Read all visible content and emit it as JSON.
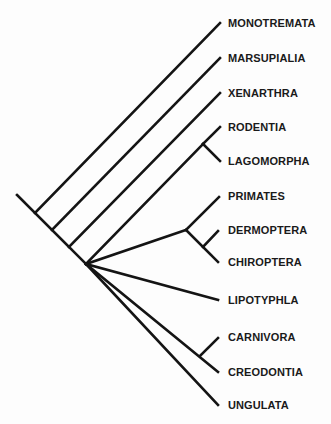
{
  "diagram": {
    "type": "cladogram",
    "colors": {
      "line": "#141414",
      "text": "#1a1a1a",
      "background": "#fdfdfd"
    },
    "taxa": [
      {
        "label": "MONOTREMATA",
        "y": 23
      },
      {
        "label": "MARSUPIALIA",
        "y": 58
      },
      {
        "label": "XENARTHRA",
        "y": 93
      },
      {
        "label": "RODENTIA",
        "y": 127
      },
      {
        "label": "LAGOMORPHA",
        "y": 161
      },
      {
        "label": "PRIMATES",
        "y": 196
      },
      {
        "label": "DERMOPTERA",
        "y": 230
      },
      {
        "label": "CHIROPTERA",
        "y": 262
      },
      {
        "label": "LIPOTYPHLA",
        "y": 300
      },
      {
        "label": "CARNIVORA",
        "y": 337
      },
      {
        "label": "CREODONTIA",
        "y": 372
      },
      {
        "label": "UNGULATA",
        "y": 405
      }
    ],
    "edges": [
      {
        "name": "root-stem",
        "x1": 17,
        "y1": 195,
        "x2": 86,
        "y2": 264
      },
      {
        "name": "branch-monotremata",
        "x1": 35,
        "y1": 213,
        "x2": 220,
        "y2": 23
      },
      {
        "name": "branch-marsupialia",
        "x1": 52,
        "y1": 230,
        "x2": 220,
        "y2": 58
      },
      {
        "name": "branch-xenarthra",
        "x1": 69,
        "y1": 247,
        "x2": 220,
        "y2": 93
      },
      {
        "name": "branch-glires",
        "x1": 86,
        "y1": 264,
        "x2": 203,
        "y2": 144
      },
      {
        "name": "branch-rodentia",
        "x1": 203,
        "y1": 144,
        "x2": 220,
        "y2": 127
      },
      {
        "name": "branch-lagomorpha",
        "x1": 203,
        "y1": 144,
        "x2": 220,
        "y2": 161
      },
      {
        "name": "branch-archonta",
        "x1": 86,
        "y1": 264,
        "x2": 186,
        "y2": 230
      },
      {
        "name": "branch-primates",
        "x1": 186,
        "y1": 230,
        "x2": 219,
        "y2": 197
      },
      {
        "name": "branch-volitantia",
        "x1": 186,
        "y1": 230,
        "x2": 218,
        "y2": 262
      },
      {
        "name": "branch-dermoptera",
        "x1": 203,
        "y1": 247,
        "x2": 218,
        "y2": 231
      },
      {
        "name": "branch-lipotyphla",
        "x1": 86,
        "y1": 264,
        "x2": 218,
        "y2": 300
      },
      {
        "name": "branch-ferae",
        "x1": 86,
        "y1": 264,
        "x2": 218,
        "y2": 372
      },
      {
        "name": "branch-carnivora",
        "x1": 200,
        "y1": 356,
        "x2": 218,
        "y2": 338
      },
      {
        "name": "branch-ungulata",
        "x1": 86,
        "y1": 264,
        "x2": 218,
        "y2": 405
      }
    ]
  }
}
